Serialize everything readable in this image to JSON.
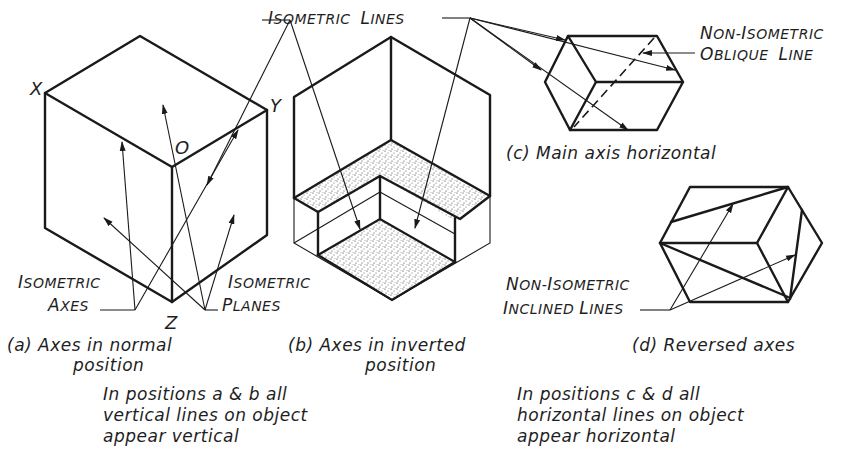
{
  "figure": {
    "panels": [
      {
        "id": "a",
        "caption_line1": "(a) Axes in normal",
        "caption_line2": "position",
        "axis_labels": {
          "x": "X",
          "y": "Y",
          "z": "Z",
          "origin": "O"
        },
        "callouts": [
          {
            "cap1": "I",
            "rest1": "SOMETRIC",
            "cap2": "A",
            "rest2": "XES"
          },
          {
            "cap1": "I",
            "rest1": "SOMETRIC",
            "cap2": "P",
            "rest2": "LANES"
          }
        ]
      },
      {
        "id": "b",
        "caption_line1": "(b) Axes in inverted",
        "caption_line2": "position",
        "callout": {
          "cap1": "I",
          "rest1": "SOMETRIC",
          "cap2": "L",
          "rest2": "INES"
        }
      },
      {
        "id": "c",
        "caption_line1": "(c) Main axis horizontal",
        "callout": {
          "cap1": "N",
          "rest1": "ON-",
          "cap1b": "I",
          "rest1b": "SOMETRIC",
          "cap2": "O",
          "rest2": "BLIQUE",
          "cap3": "L",
          "rest3": "INE"
        }
      },
      {
        "id": "d",
        "caption_line1": "(d) Reversed axes",
        "callout": {
          "cap1": "N",
          "rest1": "ON-",
          "cap1b": "I",
          "rest1b": "SOMETRIC",
          "cap2": "I",
          "rest2": "NCLINED",
          "cap3": "L",
          "rest3": "INES"
        }
      }
    ],
    "notes": {
      "left": [
        "In positions a & b all",
        "vertical lines on object",
        "appear vertical"
      ],
      "right": [
        "In positions c & d all",
        "horizontal lines on object",
        "appear horizontal"
      ]
    }
  }
}
